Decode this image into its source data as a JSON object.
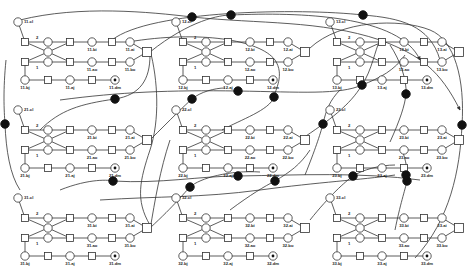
{
  "diagram": {
    "type": "petri-net",
    "background": "#ffffff",
    "stroke_color": "#333333",
    "resource_place_color": "#111111",
    "module_origins": {
      "11": [
        0,
        0
      ],
      "12": [
        158,
        0
      ],
      "13": [
        312,
        0
      ],
      "21": [
        0,
        88
      ],
      "22": [
        158,
        88
      ],
      "23": [
        312,
        88
      ],
      "31": [
        0,
        176
      ],
      "32": [
        158,
        176
      ],
      "33": [
        312,
        176
      ]
    },
    "modules": [
      {
        "id": "11",
        "labels": {
          "cl": "11.cl",
          "bi": "11.bi",
          "ai": "11.ai",
          "ao": "11.ao",
          "bo": "11.bo",
          "bj": "11.bj",
          "aj": "11.aj",
          "dm": "11.dm"
        },
        "arc_weight_top": "2",
        "arc_weight_bottom": "1"
      },
      {
        "id": "12",
        "labels": {
          "cl": "12.cl",
          "bi": "12.bi",
          "ai": "12.ai",
          "ao": "12.ao",
          "bo": "12.bo",
          "bj": "12.bj",
          "aj": "12.aj",
          "dm": "12.dm"
        },
        "arc_weight_top": "2",
        "arc_weight_bottom": "1"
      },
      {
        "id": "13",
        "labels": {
          "cl": "13.cl",
          "bi": "13.bi",
          "ai": "13.ai",
          "ao": "13.ao",
          "bo": "13.bo",
          "bj": "13.bj",
          "aj": "13.aj",
          "dm": "13.dm"
        },
        "arc_weight_top": "2",
        "arc_weight_bottom": "1"
      },
      {
        "id": "21",
        "labels": {
          "cl": "21.cl",
          "bi": "21.bi",
          "ai": "21.ai",
          "ao": "21.ao",
          "bo": "21.bo",
          "bj": "21.bj",
          "aj": "21.aj",
          "dm": "21.dm"
        },
        "arc_weight_top": "2",
        "arc_weight_bottom": "1"
      },
      {
        "id": "22",
        "labels": {
          "cl": "22.cl",
          "bi": "22.bi",
          "ai": "22.ai",
          "ao": "22.ao",
          "bo": "22.bo",
          "bj": "22.bj",
          "aj": "22.aj",
          "dm": "22.dm"
        },
        "arc_weight_top": "2",
        "arc_weight_bottom": "1"
      },
      {
        "id": "23",
        "labels": {
          "cl": "23.cl",
          "bi": "23.bi",
          "ai": "23.ai",
          "ao": "23.ao",
          "bo": "23.bo",
          "bj": "23.bj",
          "aj": "23.aj",
          "dm": "23.dm"
        },
        "arc_weight_top": "2",
        "arc_weight_bottom": "1"
      },
      {
        "id": "31",
        "labels": {
          "cl": "31.cl",
          "bi": "31.bi",
          "ai": "31.ai",
          "ao": "31.ao",
          "bo": "31.bo",
          "bj": "31.bj",
          "aj": "31.aj",
          "dm": "31.dm"
        },
        "arc_weight_top": "2",
        "arc_weight_bottom": "1"
      },
      {
        "id": "32",
        "labels": {
          "cl": "32.cl",
          "bi": "32.bi",
          "ai": "32.ai",
          "ao": "32.ao",
          "bo": "32.bo",
          "bj": "32.bj",
          "aj": "32.aj",
          "dm": "32.dm"
        },
        "arc_weight_top": "2",
        "arc_weight_bottom": "1"
      },
      {
        "id": "33",
        "labels": {
          "cl": "33.cl",
          "bi": "33.bi",
          "ai": "33.ai",
          "ao": "33.ao",
          "bo": "33.bo",
          "bj": "33.bj",
          "aj": "33.aj",
          "dm": "33.dm"
        },
        "arc_weight_top": "2",
        "arc_weight_bottom": "1"
      }
    ],
    "resource_places": [
      {
        "id": "r1",
        "x": 192,
        "y": 17
      },
      {
        "id": "r2",
        "x": 231,
        "y": 15
      },
      {
        "id": "r3",
        "x": 363,
        "y": 15
      },
      {
        "id": "r4",
        "x": 238,
        "y": 91
      },
      {
        "id": "r5",
        "x": 115,
        "y": 99
      },
      {
        "id": "r6",
        "x": 192,
        "y": 99
      },
      {
        "id": "r7",
        "x": 274,
        "y": 97
      },
      {
        "id": "r8",
        "x": 5,
        "y": 124
      },
      {
        "id": "r9",
        "x": 362,
        "y": 85
      },
      {
        "id": "r10",
        "x": 406,
        "y": 94
      },
      {
        "id": "r11",
        "x": 323,
        "y": 124
      },
      {
        "id": "r12",
        "x": 462,
        "y": 125
      },
      {
        "id": "r13",
        "x": 113,
        "y": 181
      },
      {
        "id": "r14",
        "x": 238,
        "y": 176
      },
      {
        "id": "r15",
        "x": 190,
        "y": 187
      },
      {
        "id": "r16",
        "x": 275,
        "y": 181
      },
      {
        "id": "r17",
        "x": 353,
        "y": 176
      },
      {
        "id": "r18",
        "x": 407,
        "y": 181
      },
      {
        "id": "r19",
        "x": 406,
        "y": 175
      }
    ]
  }
}
